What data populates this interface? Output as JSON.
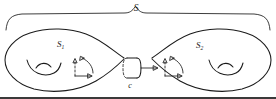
{
  "figure": {
    "kind": "mathematical-diagram",
    "width": 276,
    "height": 99,
    "background_color": "#ffffff",
    "ink_color": "#1a1a1a"
  },
  "labels": {
    "whole_surface": {
      "base": "S",
      "sub": "",
      "x": 136,
      "y": 11
    },
    "left_piece": {
      "base": "S",
      "sub": "1",
      "x": 57,
      "y": 47
    },
    "right_piece": {
      "base": "S",
      "sub": "2",
      "x": 196,
      "y": 48
    },
    "separating_curve": {
      "base": "c",
      "sub": "",
      "x": 130,
      "y": 88
    }
  },
  "annotations": {
    "brace_label": "S",
    "left_region_label": "S1",
    "right_region_label": "S2",
    "neck_curve_label": "c",
    "brace_orientation": "top",
    "neck_arrow_direction": "right",
    "frame_count": 2,
    "handle_count": 2
  },
  "colors": {
    "ink": "#1a1a1a",
    "paper": "#ffffff",
    "bottom_rule": "#3a3a3a"
  }
}
